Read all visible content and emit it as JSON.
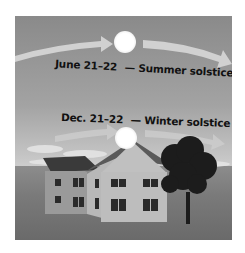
{
  "diagram": {
    "summer": {
      "date": "June 21–22",
      "label": "— Summer solstice"
    },
    "winter": {
      "date": "Dec. 21–22",
      "label": "— Winter solstice"
    },
    "elements": [
      "high-sun-path-arrow",
      "sun-summer",
      "low-sun-path-arrow",
      "sun-winter",
      "house",
      "tree",
      "clouds",
      "grass"
    ]
  }
}
